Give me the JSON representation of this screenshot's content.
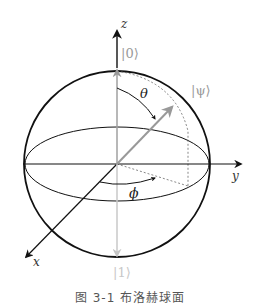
{
  "figure": {
    "type": "bloch-sphere",
    "axes": {
      "z_label": "z",
      "y_label": "y",
      "x_label": "x"
    },
    "states": {
      "zero": "|0⟩",
      "one": "|1⟩",
      "psi": "|ψ⟩"
    },
    "angles": {
      "theta": "θ",
      "phi": "ϕ"
    },
    "colors": {
      "axis": "#111111",
      "state_vector": "#999999",
      "one_axis": "#c8c8c8",
      "dotted": "#555555"
    }
  },
  "caption": "图 3-1  布洛赫球面"
}
